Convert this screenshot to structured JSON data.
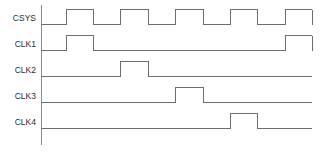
{
  "diagram": {
    "kind": "digital-timing-diagram",
    "width": 320,
    "height": 156,
    "background_color": "#ffffff",
    "wave_color": "#6e6e6e",
    "axis_color": "#8a8a8a",
    "label_color": "#2b2b2b",
    "axis": {
      "x": 41,
      "y_top": 5,
      "y_bottom": 145,
      "plot_left": 41,
      "plot_right": 312
    },
    "geometry": {
      "label_right_x": 36,
      "pulse_height": 15,
      "pulse_width": 27,
      "row_pitch": 26,
      "pulse_starts": [
        66,
        120,
        175,
        230,
        285
      ]
    },
    "signals": [
      {
        "name": "CSYS",
        "label": "CSYS",
        "baseline_y": 24,
        "top_y": 9,
        "pulses": [
          {
            "start": 66,
            "end": 93,
            "clipped_right": false
          },
          {
            "start": 120,
            "end": 148,
            "clipped_right": false
          },
          {
            "start": 175,
            "end": 203,
            "clipped_right": false
          },
          {
            "start": 230,
            "end": 257,
            "clipped_right": false
          },
          {
            "start": 285,
            "end": 312,
            "clipped_right": true
          }
        ]
      },
      {
        "name": "CLK1",
        "label": "CLK1",
        "baseline_y": 50,
        "top_y": 35,
        "pulses": [
          {
            "start": 66,
            "end": 93,
            "clipped_right": false
          },
          {
            "start": 285,
            "end": 312,
            "clipped_right": true
          }
        ]
      },
      {
        "name": "CLK2",
        "label": "CLK2",
        "baseline_y": 76,
        "top_y": 61,
        "pulses": [
          {
            "start": 120,
            "end": 148,
            "clipped_right": false
          }
        ]
      },
      {
        "name": "CLK3",
        "label": "CLK3",
        "baseline_y": 102,
        "top_y": 87,
        "pulses": [
          {
            "start": 175,
            "end": 203,
            "clipped_right": false
          }
        ]
      },
      {
        "name": "CLK4",
        "label": "CLK4",
        "baseline_y": 128,
        "top_y": 113,
        "pulses": [
          {
            "start": 230,
            "end": 257,
            "clipped_right": false
          }
        ]
      }
    ]
  }
}
